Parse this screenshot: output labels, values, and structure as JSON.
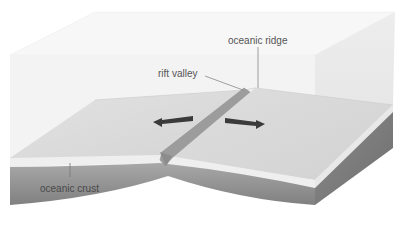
{
  "diagram": {
    "type": "block-diagram",
    "labels": {
      "ridge": "oceanic ridge",
      "rift": "rift valley",
      "crust": "oceanic crust"
    },
    "arrows": [
      {
        "direction": "left",
        "meaning": "plate moving apart"
      },
      {
        "direction": "right",
        "meaning": "plate moving apart"
      }
    ],
    "colors": {
      "water": "#f4f4f4",
      "water_side": "#ececec",
      "seafloor": "#dcdcdc",
      "crust_top_band": "#eeeeee",
      "crust_body": "#8e8e8e",
      "crust_side": "#7a7a7a",
      "rift_bar": "#9a9a9a",
      "arrow": "#3a3a3a",
      "leader_line": "#888888",
      "label_text": "#555555"
    }
  }
}
